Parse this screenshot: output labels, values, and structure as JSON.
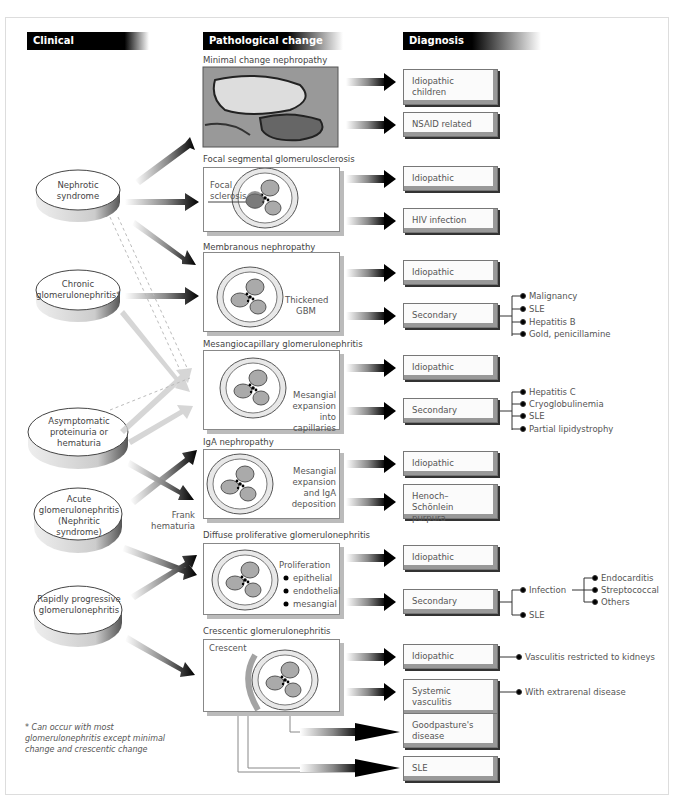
{
  "headers": {
    "clinical": "Clinical presentation",
    "pathological": "Pathological change",
    "diagnosis": "Diagnosis"
  },
  "clinical": [
    {
      "label": "Nephrotic syndrome"
    },
    {
      "label": "Chronic glomerulonephritis*"
    },
    {
      "label": "Asymptomatic proteinuria or hematuria"
    },
    {
      "label": "Acute glomerulonephritis (Nephritic syndrome)"
    },
    {
      "label": "Rapidly progressive glomerulonephritis"
    }
  ],
  "arrow_labels": {
    "frank_hematuria": "Frank hematuria"
  },
  "pathology": [
    {
      "title": "Minimal change nephropathy",
      "label": ""
    },
    {
      "title": "Focal segmental glomerulosclerosis",
      "label": "Focal sclerosis"
    },
    {
      "title": "Membranous nephropathy",
      "label": "Thickened GBM"
    },
    {
      "title": "Mesangiocapillary glomerulonephritis",
      "label": "Mesangial expansion into capillaries"
    },
    {
      "title": "IgA nephropathy",
      "label": "Mesangial expansion and IgA deposition"
    },
    {
      "title": "Diffuse proliferative glomerulonephritis",
      "label": "Proliferation",
      "bullets": [
        "epithelial",
        "endothelial",
        "mesangial"
      ]
    },
    {
      "title": "Crescentic glomerulonephritis",
      "label": "Crescent"
    }
  ],
  "diagnosis": {
    "minimal": [
      "Idiopathic children",
      "NSAID related"
    ],
    "focal": [
      "Idiopathic",
      "HIV infection"
    ],
    "membranous": [
      "Idiopathic",
      "Secondary"
    ],
    "mesangiocapillary": [
      "Idiopathic",
      "Secondary"
    ],
    "iga": [
      "Idiopathic",
      "Henoch–Schönlein purpura"
    ],
    "diffuse": [
      "Idiopathic",
      "Secondary"
    ],
    "crescentic": [
      "Idiopathic",
      "Systemic vasculitis",
      "Goodpasture's disease",
      "SLE"
    ]
  },
  "causes": {
    "membranous_secondary": [
      "Malignancy",
      "SLE",
      "Hepatitis B",
      "Gold, penicillamine"
    ],
    "mesangiocapillary_secondary": [
      "Hepatitis C",
      "Cryoglobulinemia",
      "SLE",
      "Partial lipidystrophy"
    ],
    "diffuse_secondary": [
      "Infection",
      "SLE"
    ],
    "infection": [
      "Endocarditis",
      "Streptococcal",
      "Others"
    ],
    "crescentic_idiopathic": "Vasculitis restricted to kidneys",
    "crescentic_systemic": "With extrarenal disease"
  },
  "footnote": "* Can occur with most glomerulonephritis except minimal change and crescentic change"
}
